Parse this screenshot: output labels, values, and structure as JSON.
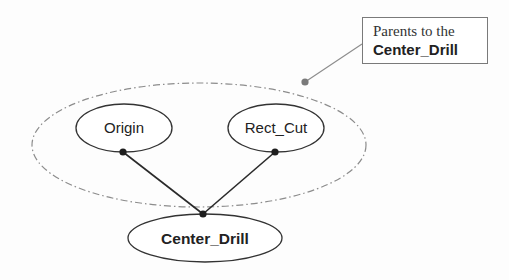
{
  "diagram": {
    "type": "parent-child dependency graph",
    "nodes": [
      {
        "id": "origin",
        "label": "Origin",
        "role": "parent"
      },
      {
        "id": "rect_cut",
        "label": "Rect_Cut",
        "role": "parent"
      },
      {
        "id": "center_drill",
        "label": "Center_Drill",
        "role": "child"
      }
    ],
    "edges": [
      {
        "from": "origin",
        "to": "center_drill"
      },
      {
        "from": "rect_cut",
        "to": "center_drill"
      }
    ],
    "group": {
      "label_line1": "Parents to the",
      "label_line2": "Center_Drill",
      "members": [
        "origin",
        "rect_cut"
      ]
    }
  },
  "colors": {
    "node_stroke": "#333333",
    "edge": "#2a2a2a",
    "group_stroke": "#8c8c8c",
    "callout_border": "#7a7a7a"
  }
}
